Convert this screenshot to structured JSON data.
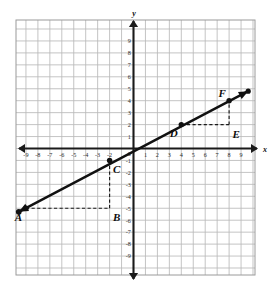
{
  "figure": {
    "axis_labels": {
      "x": "x",
      "y": "y"
    },
    "origin_label": "0",
    "grid": {
      "x_min": -10,
      "x_max": 10,
      "y_min": -10,
      "y_max": 10,
      "step": 1,
      "show_grid": true,
      "grid_color": "#b9b9b9",
      "frame_color": "#9a9a9a",
      "background": "#ffffff"
    },
    "axes": {
      "color": "#1a1a1a",
      "x_ticks": [
        -9,
        -8,
        -7,
        -6,
        -5,
        -4,
        -3,
        -2,
        1,
        2,
        3,
        4,
        5,
        6,
        7,
        8,
        9
      ],
      "y_ticks": [
        9,
        8,
        7,
        6,
        5,
        4,
        3,
        2,
        1,
        -1,
        -2,
        -3,
        -4,
        -5,
        -6,
        -7,
        -8,
        -9
      ],
      "x_tick_labels": [
        "-9",
        "-8",
        "-7",
        "-6",
        "-5",
        "-4",
        "-3",
        "-2",
        "1",
        "2",
        "3",
        "4",
        "5",
        "6",
        "7",
        "8",
        "9"
      ],
      "y_tick_labels": [
        "9",
        "8",
        "7",
        "6",
        "5",
        "4",
        "3",
        "2",
        "1",
        "-1",
        "-2",
        "-3",
        "-4",
        "-5",
        "-6",
        "-7",
        "-8",
        "-9"
      ],
      "arrow_both_ends": true
    }
  },
  "chart_data": {
    "type": "scatter",
    "xlabel": "x",
    "ylabel": "y",
    "xlim": [
      -10,
      10
    ],
    "ylim": [
      -10,
      10
    ],
    "grid": true,
    "line": {
      "name": "line AF",
      "slope": 0.5,
      "y_intercept": 0,
      "equation": "y = 0.5x",
      "color": "#111111",
      "width": 2.4,
      "arrow_start": [
        -9.6,
        -5.3
      ],
      "arrow_end": [
        9.6,
        4.8
      ],
      "endpoints_have_arrowheads": true
    },
    "points": [
      {
        "label": "A",
        "x": -9,
        "y": -5,
        "marker": "filled-dot",
        "label_pos": "below-left",
        "on_line": true
      },
      {
        "label": "B",
        "x": -2,
        "y": -5,
        "marker": "none",
        "label_pos": "below-right",
        "on_line": false
      },
      {
        "label": "C",
        "x": -2,
        "y": -1,
        "marker": "filled-dot",
        "label_pos": "below-right",
        "on_line": true
      },
      {
        "label": "D",
        "x": 4,
        "y": 2,
        "marker": "filled-dot",
        "label_pos": "below-left",
        "on_line": true
      },
      {
        "label": "E",
        "x": 8,
        "y": 2,
        "marker": "none",
        "label_pos": "below-right",
        "on_line": false
      },
      {
        "label": "F",
        "x": 8,
        "y": 4,
        "marker": "filled-dot",
        "label_pos": "above-left",
        "on_line": true
      }
    ],
    "dashed_segments": [
      {
        "name": "A-B",
        "from": [
          -9,
          -5
        ],
        "to": [
          -2,
          -5
        ],
        "style": "dashed",
        "run": 7
      },
      {
        "name": "B-C",
        "from": [
          -2,
          -5
        ],
        "to": [
          -2,
          -1
        ],
        "style": "dashed",
        "rise": 4
      },
      {
        "name": "D-E",
        "from": [
          4,
          2
        ],
        "to": [
          8,
          2
        ],
        "style": "dashed",
        "run": 4
      },
      {
        "name": "E-F",
        "from": [
          8,
          2
        ],
        "to": [
          8,
          4
        ],
        "style": "dashed",
        "rise": 2
      }
    ],
    "dash_color": "#1a1a1a"
  }
}
